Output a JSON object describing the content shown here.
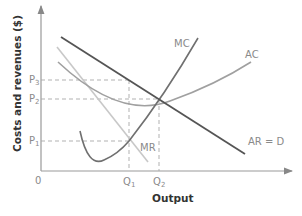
{
  "diagram": {
    "title": "",
    "axes": {
      "y_label": "Costs and revenues ($)",
      "x_label": "Output",
      "origin": "0"
    },
    "price_levels": [
      {
        "id": "P3",
        "main": "P",
        "sub": "3"
      },
      {
        "id": "P2",
        "main": "P",
        "sub": "2"
      },
      {
        "id": "P1",
        "main": "P",
        "sub": "1"
      }
    ],
    "quantity_levels": [
      {
        "id": "Q1",
        "main": "Q",
        "sub": "1"
      },
      {
        "id": "Q2",
        "main": "Q",
        "sub": "2"
      }
    ],
    "curves": {
      "mc": {
        "label": "MC",
        "color": "#707070"
      },
      "ac": {
        "label": "AC",
        "color": "#a0a0a0"
      },
      "mr": {
        "label": "MR",
        "color": "#c8c8c8"
      },
      "ar": {
        "label": "AR = D",
        "color": "#555555"
      }
    },
    "guide_color": "#a8a8a8"
  }
}
